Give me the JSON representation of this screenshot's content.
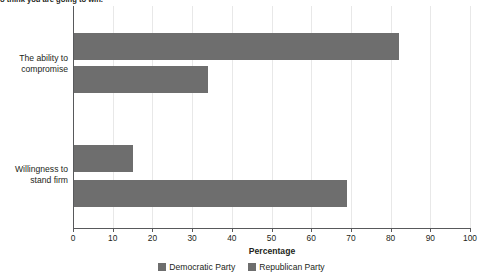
{
  "caption": "o think you are going to win.",
  "chart_data": {
    "type": "bar",
    "orientation": "horizontal",
    "title": "",
    "xlabel": "Percentage",
    "ylabel": "",
    "xlim": [
      0,
      100
    ],
    "grid": true,
    "legend_position": "bottom",
    "categories": [
      "The ability to compromise",
      "Willingness to stand firm"
    ],
    "category_lines": [
      [
        "The ability to",
        "compromise"
      ],
      [
        "Willingness to",
        "stand firm"
      ]
    ],
    "tick_labels": [
      "0",
      "10",
      "20",
      "30",
      "40",
      "50",
      "60",
      "70",
      "80",
      "90",
      "100"
    ],
    "tick_values": [
      0,
      10,
      20,
      30,
      40,
      50,
      60,
      70,
      80,
      90,
      100
    ],
    "series": [
      {
        "name": "Democratic Party",
        "color": "#6e6e6e",
        "values": [
          82,
          15
        ]
      },
      {
        "name": "Republican Party",
        "color": "#6e6e6e",
        "values": [
          34,
          69
        ]
      }
    ]
  },
  "colors": {
    "bar": "#6e6e6e",
    "axis": "#58595b",
    "grid": "#e8e8e8",
    "text": "#231f20",
    "background": "#ffffff"
  }
}
